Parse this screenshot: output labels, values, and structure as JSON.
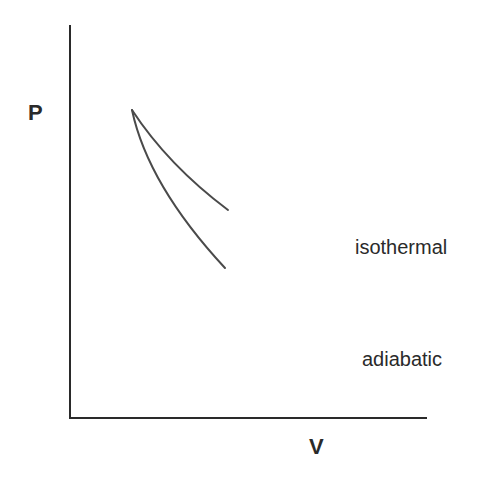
{
  "diagram": {
    "title": "",
    "y_axis": {
      "label": "P"
    },
    "x_axis": {
      "label": "V"
    },
    "curves": [
      {
        "name": "isothermal",
        "label": "isothermal"
      },
      {
        "name": "adiabatic",
        "label": "adiabatic"
      }
    ],
    "colors": {
      "axis": "#2a2a2a",
      "curve": "#4a4a4a",
      "background": "#ffffff"
    }
  }
}
